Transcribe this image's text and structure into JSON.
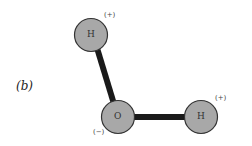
{
  "panel_label": "(b)",
  "molecule": {
    "atoms": [
      {
        "id": "H1",
        "symbol": "H",
        "charge": "(+)",
        "cx": 91,
        "cy": 35
      },
      {
        "id": "O",
        "symbol": "O",
        "charge": "(−)",
        "cx": 118,
        "cy": 117
      },
      {
        "id": "H2",
        "symbol": "H",
        "charge": "(+)",
        "cx": 201,
        "cy": 117
      }
    ],
    "bonds": [
      [
        "H1",
        "O"
      ],
      [
        "O",
        "H2"
      ]
    ]
  },
  "colors": {
    "atom_fill": "#a8a8a8",
    "atom_stroke": "#333333",
    "bond": "#1a1a1a"
  }
}
